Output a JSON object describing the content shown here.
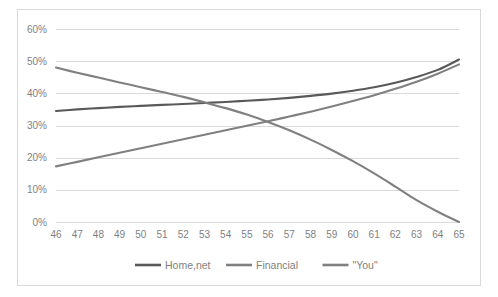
{
  "chart_data": {
    "type": "line",
    "title": "",
    "subtitle": "",
    "xlabel": "",
    "ylabel": "",
    "x": [
      46,
      47,
      48,
      49,
      50,
      51,
      52,
      53,
      54,
      55,
      56,
      57,
      58,
      59,
      60,
      61,
      62,
      63,
      64,
      65
    ],
    "xlim": [
      46,
      65
    ],
    "ylim": [
      0,
      60
    ],
    "ytick_labels": [
      "0%",
      "10%",
      "20%",
      "30%",
      "40%",
      "50%",
      "60%"
    ],
    "ytick_values": [
      0,
      10,
      20,
      30,
      40,
      50,
      60
    ],
    "xtick_labels": [
      "46",
      "47",
      "48",
      "49",
      "50",
      "51",
      "52",
      "53",
      "54",
      "55",
      "56",
      "57",
      "58",
      "59",
      "60",
      "61",
      "62",
      "63",
      "64",
      "65"
    ],
    "grid": "horizontal",
    "legend_position": "bottom",
    "series": [
      {
        "name": "Home,net",
        "color": "#595959",
        "values": [
          34.5,
          35.0,
          35.4,
          35.8,
          36.1,
          36.4,
          36.7,
          37.0,
          37.3,
          37.7,
          38.1,
          38.6,
          39.2,
          39.9,
          40.8,
          41.9,
          43.3,
          45.1,
          47.3,
          50.5
        ]
      },
      {
        "name": "Financial",
        "color": "#808080",
        "values": [
          17.3,
          18.7,
          20.1,
          21.5,
          22.9,
          24.3,
          25.7,
          27.1,
          28.5,
          29.9,
          31.3,
          32.8,
          34.3,
          35.9,
          37.6,
          39.4,
          41.4,
          43.6,
          46.1,
          49.0
        ]
      },
      {
        "name": "\"You\"",
        "color": "#808080",
        "values": [
          48.0,
          46.4,
          44.9,
          43.4,
          41.9,
          40.4,
          38.9,
          37.2,
          35.4,
          33.4,
          31.1,
          28.5,
          25.6,
          22.4,
          18.9,
          15.1,
          11.0,
          6.8,
          3.2,
          0.0
        ]
      }
    ]
  },
  "legend": {
    "items": [
      {
        "label": "Home,net",
        "color": "#595959"
      },
      {
        "label": "Financial",
        "color": "#808080"
      },
      {
        "label": "\"You\"",
        "color": "#808080"
      }
    ]
  },
  "colors": {
    "gridline": "#d9d9d9",
    "frame_border": "#d9d9d9",
    "tick_text": "#7f7f7f",
    "background": "#ffffff"
  }
}
